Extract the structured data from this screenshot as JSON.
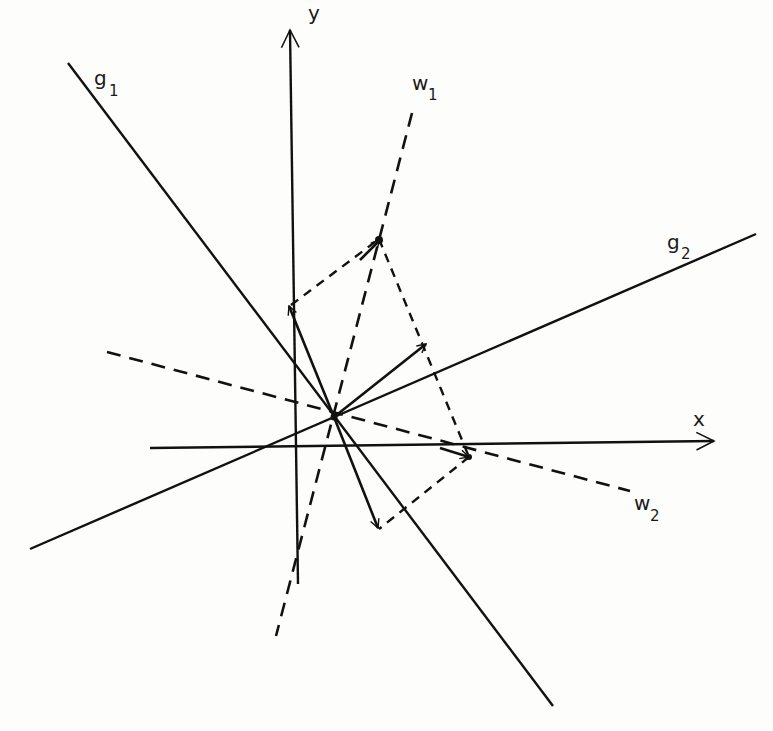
{
  "diagram": {
    "type": "vector-decomposition",
    "axes": {
      "x_label": "x",
      "y_label": "y"
    },
    "lines": {
      "g1": {
        "label": "g",
        "subscript": "1",
        "style": "solid"
      },
      "g2": {
        "label": "g",
        "subscript": "2",
        "style": "solid"
      },
      "w1": {
        "label": "w",
        "subscript": "1",
        "style": "dashed"
      },
      "w2": {
        "label": "w",
        "subscript": "2",
        "style": "dashed"
      }
    },
    "origin_point": [
      334,
      417
    ],
    "vectors": [
      {
        "name": "resultant-arrow",
        "from": [
          334,
          417
        ],
        "to": [
          426,
          344
        ]
      },
      {
        "name": "g1-component-arrow-up",
        "from": [
          334,
          417
        ],
        "to": [
          289,
          306
        ]
      },
      {
        "name": "g1-component-arrow-down",
        "from": [
          334,
          417
        ],
        "to": [
          378,
          528
        ]
      }
    ],
    "projection_points": {
      "w1_point": [
        379,
        239
      ],
      "w2_point": [
        469,
        457
      ]
    },
    "colors": {
      "ink": "#111111",
      "paper": "#fdfdfb"
    }
  }
}
